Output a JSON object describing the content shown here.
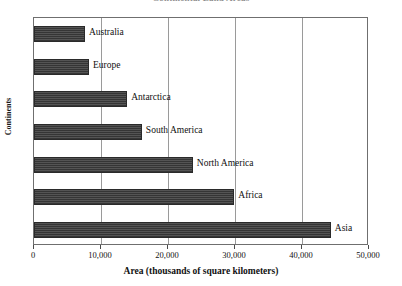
{
  "chart_data": {
    "type": "bar",
    "orientation": "horizontal",
    "title": "Continental Land Areas",
    "xlabel": "Area (thousands of square kilometers)",
    "ylabel": "Continents",
    "categories": [
      "Australia",
      "Europe",
      "Antarctica",
      "South America",
      "North America",
      "Africa",
      "Asia"
    ],
    "values": [
      7600,
      8200,
      13900,
      16100,
      23700,
      29900,
      44300
    ],
    "xlim": [
      0,
      50000
    ],
    "xticks": [
      0,
      10000,
      20000,
      30000,
      40000,
      50000
    ],
    "xticklabels": [
      "0",
      "10,000",
      "20,000",
      "30,000",
      "40,000",
      "50,000"
    ],
    "grid": "vertical",
    "legend": "none",
    "bar_color": "#3b3b3b"
  },
  "axis": {
    "y_caption": "Continents",
    "x_caption": "Area (thousands of square kilometers)"
  },
  "bars": [
    {
      "label": "Australia",
      "value": 7600
    },
    {
      "label": "Europe",
      "value": 8200
    },
    {
      "label": "Antarctica",
      "value": 13900
    },
    {
      "label": "South America",
      "value": 16100
    },
    {
      "label": "North America",
      "value": 23700
    },
    {
      "label": "Africa",
      "value": 29900
    },
    {
      "label": "Asia",
      "value": 44300
    }
  ],
  "xticklabels": [
    "0",
    "10,000",
    "20,000",
    "30,000",
    "40,000",
    "50,000"
  ]
}
